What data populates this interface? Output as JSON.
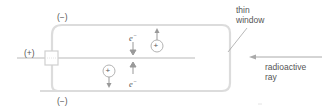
{
  "diagram": {
    "labels": {
      "top_negative": "(−)",
      "bottom_negative": "(−)",
      "anode_positive": "(+)",
      "thin_window": "thin\nwindow",
      "thin_window_line1": "thin",
      "thin_window_line2": "window",
      "radioactive_ray_line1": "radioactive",
      "radioactive_ray_line2": "ray",
      "electron_top": "e",
      "electron_bottom": "e",
      "electron_charge": "−",
      "ion_plus_1": "+",
      "ion_plus_2": "+"
    },
    "colors": {
      "tube_outline": "#d8d8d8",
      "wire": "#cccccc",
      "arrow": "#999999",
      "text": "#555555",
      "leader_line": "#888888"
    }
  }
}
